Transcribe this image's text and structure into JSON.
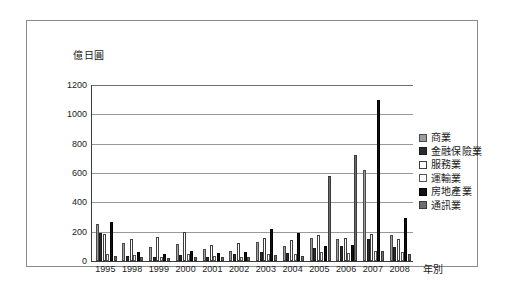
{
  "chart_data": {
    "type": "bar",
    "title": "",
    "subtitle": "",
    "xlabel": "年別",
    "ylabel": "億日圓",
    "ylim": [
      0,
      1200
    ],
    "yticks": [
      0,
      200,
      400,
      600,
      800,
      1000,
      1200
    ],
    "grid": true,
    "legend_position": "right",
    "categories": [
      "1995",
      "1998",
      "1999",
      "2000",
      "2001",
      "2002",
      "2003",
      "2004",
      "2005",
      "2006",
      "2007",
      "2008"
    ],
    "series": [
      {
        "name": "商業",
        "color": "#9d9d9d",
        "values": [
          250,
          120,
          95,
          115,
          80,
          70,
          130,
          105,
          160,
          150,
          620,
          175
        ]
      },
      {
        "name": "金融保險業",
        "color": "#2b2b2b",
        "values": [
          190,
          35,
          25,
          40,
          30,
          45,
          60,
          55,
          90,
          100,
          150,
          95
        ]
      },
      {
        "name": "服務業",
        "color": "#ffffff",
        "values": [
          185,
          150,
          165,
          195,
          110,
          120,
          155,
          140,
          175,
          160,
          185,
          150
        ]
      },
      {
        "name": "運輸業",
        "color": "#fbfbfb",
        "values": [
          50,
          40,
          30,
          45,
          35,
          30,
          50,
          45,
          60,
          55,
          70,
          60
        ]
      },
      {
        "name": "房地產業",
        "color": "#111111",
        "values": [
          265,
          60,
          50,
          70,
          55,
          60,
          215,
          190,
          100,
          110,
          1100,
          290
        ]
      },
      {
        "name": "通訊業",
        "color": "#6e6e6e",
        "values": [
          35,
          25,
          20,
          30,
          25,
          25,
          40,
          35,
          580,
          720,
          65,
          45
        ]
      }
    ]
  },
  "legend": {
    "items": [
      {
        "label": "商業",
        "swatch_class": "s0"
      },
      {
        "label": "金融保險業",
        "swatch_class": "s1"
      },
      {
        "label": "服務業",
        "swatch_class": "s2"
      },
      {
        "label": "運輸業",
        "swatch_class": "s3"
      },
      {
        "label": "房地產業",
        "swatch_class": "s4"
      },
      {
        "label": "通訊業",
        "swatch_class": "s5"
      }
    ]
  }
}
